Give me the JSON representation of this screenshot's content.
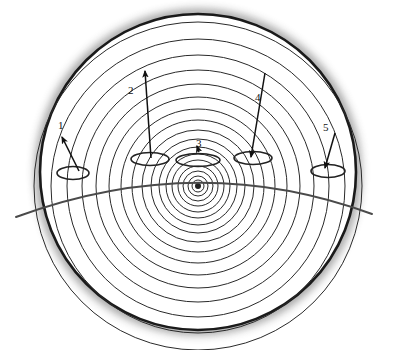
{
  "figure": {
    "title": "",
    "background_color": "#ffffff",
    "stroke_color": "#1a1a1a",
    "shadow_color": "#8c8c8c",
    "outer_circle": {
      "name": "outer-boundary-circle",
      "cx": 198,
      "cy": 172,
      "r": 158,
      "stroke_width": 2.6
    },
    "rings": {
      "name": "concentric-wave-rings",
      "cx": 198,
      "cy": 186,
      "count": 17,
      "radii": [
        6,
        10,
        15,
        20,
        26,
        32,
        39,
        47,
        56,
        66,
        77,
        89,
        102,
        116,
        131,
        147,
        164
      ],
      "stroke_width": 1.0,
      "core_dot_radius": 3
    },
    "horizon_arc": {
      "name": "horizon-arc",
      "start_x": 16,
      "start_y": 217,
      "control_x": 198,
      "control_y": 150,
      "end_x": 372,
      "end_y": 214,
      "stroke_width": 2.0
    },
    "ellipses": [
      {
        "name": "vent-ellipse-1",
        "cx": 73,
        "cy": 173,
        "rx": 16,
        "ry": 6.5
      },
      {
        "name": "vent-ellipse-2",
        "cx": 150,
        "cy": 159,
        "rx": 19,
        "ry": 6.5
      },
      {
        "name": "vent-ellipse-3",
        "cx": 198,
        "cy": 160,
        "rx": 22,
        "ry": 6.5
      },
      {
        "name": "vent-ellipse-4",
        "cx": 253,
        "cy": 158,
        "rx": 19,
        "ry": 6.5
      },
      {
        "name": "vent-ellipse-5",
        "cx": 328,
        "cy": 171,
        "rx": 17,
        "ry": 6.5
      }
    ]
  },
  "callouts": [
    {
      "id": "1",
      "label": "1",
      "label_x": 58,
      "label_y": 120,
      "arrow": {
        "x1": 79,
        "y1": 171,
        "x2": 62,
        "y2": 137,
        "direction": "up-left",
        "head": "end"
      }
    },
    {
      "id": "2",
      "label": "2",
      "label_x": 128,
      "label_y": 85,
      "arrow": {
        "x1": 151,
        "y1": 158,
        "x2": 145,
        "y2": 71,
        "direction": "up",
        "head": "end"
      }
    },
    {
      "id": "3",
      "label": "3",
      "label_x": 196,
      "label_y": 138,
      "arrow": {
        "x1": 199,
        "y1": 152,
        "x2": 197,
        "y2": 146,
        "direction": "down",
        "head": "end"
      }
    },
    {
      "id": "4",
      "label": "4",
      "label_x": 255,
      "label_y": 92,
      "arrow": {
        "x1": 265,
        "y1": 73,
        "x2": 251,
        "y2": 157,
        "direction": "down-left",
        "head": "end"
      }
    },
    {
      "id": "5",
      "label": "5",
      "label_x": 323,
      "label_y": 122,
      "arrow": {
        "x1": 335,
        "y1": 133,
        "x2": 325,
        "y2": 168,
        "direction": "down-left",
        "head": "end"
      }
    }
  ]
}
